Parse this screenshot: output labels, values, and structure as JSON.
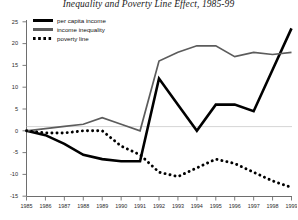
{
  "chart_data": {
    "type": "line",
    "title": "Inequality and Poverty Line Effect, 1985-99",
    "xlabel": "",
    "ylabel": "",
    "xlim": [
      1985,
      1999
    ],
    "ylim": [
      -15,
      25
    ],
    "yticks": [
      25,
      20,
      15,
      10,
      5,
      0,
      -5,
      -10,
      -15
    ],
    "xticks": [
      1985,
      1986,
      1987,
      1988,
      1989,
      1990,
      1991,
      1992,
      1993,
      1994,
      1995,
      1996,
      1997,
      1998,
      1999
    ],
    "grid": false,
    "legend_position": "top-left",
    "categories": [
      1985,
      1986,
      1987,
      1988,
      1989,
      1990,
      1991,
      1992,
      1993,
      1994,
      1995,
      1996,
      1997,
      1998,
      1999
    ],
    "series": [
      {
        "name": "per capita income",
        "color": "#000000",
        "style": "solid-thick",
        "values": [
          0,
          -1,
          -3,
          -5.5,
          -6.5,
          -7,
          -7,
          12,
          6,
          0,
          6,
          6,
          4.5,
          14,
          23.5
        ]
      },
      {
        "name": "income inequality",
        "color": "#5c5c5c",
        "style": "solid",
        "values": [
          0,
          0.5,
          1,
          1.5,
          3,
          1.5,
          0,
          16,
          18,
          19.5,
          19.5,
          17,
          18,
          17.5,
          18
        ]
      },
      {
        "name": "poverty line",
        "color": "#000000",
        "style": "dotted",
        "values": [
          0,
          -0.5,
          -0.5,
          0,
          0,
          -3.5,
          -5.5,
          -9.5,
          -10.5,
          -8.5,
          -6.5,
          -7.5,
          -9.5,
          -11.5,
          -13
        ]
      }
    ]
  },
  "legend": {
    "items": [
      {
        "label": "per capita income",
        "swatch": "solid-black-thick"
      },
      {
        "label": "income inequality",
        "swatch": "solid-gray"
      },
      {
        "label": "poverty line",
        "swatch": "dotted-black"
      }
    ]
  }
}
